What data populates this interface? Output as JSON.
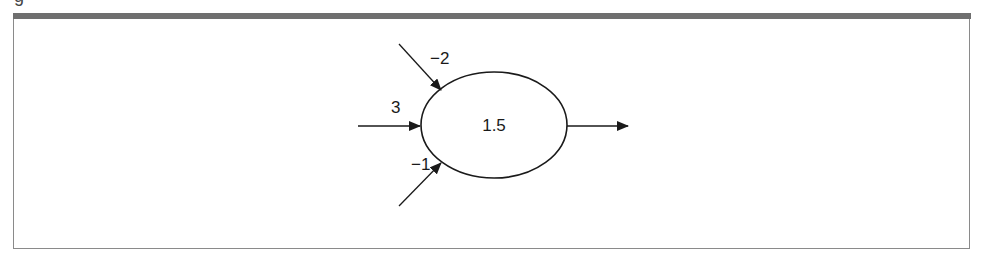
{
  "figure": {
    "caption_fragment": "g",
    "node": {
      "threshold_label": "1.5",
      "center": [
        494,
        125
      ],
      "rx": 73,
      "ry": 53
    },
    "inputs": [
      {
        "weight_label": "−2",
        "from": [
          399,
          44
        ],
        "to": [
          441,
          90
        ],
        "label_pos": [
          430,
          64
        ]
      },
      {
        "weight_label": "3",
        "from": [
          358,
          126
        ],
        "to": [
          419,
          126
        ],
        "label_pos": [
          391,
          113
        ]
      },
      {
        "weight_label": "−1",
        "from": [
          399,
          206
        ],
        "to": [
          441,
          163
        ],
        "label_pos": [
          411,
          170
        ]
      }
    ],
    "output": {
      "from": [
        567,
        126
      ],
      "to": [
        628,
        126
      ]
    },
    "colors": {
      "stroke": "#1a1a1a",
      "frame": "#8a8a8a",
      "topbar": "#6f6f6f",
      "background": "#ffffff"
    }
  }
}
